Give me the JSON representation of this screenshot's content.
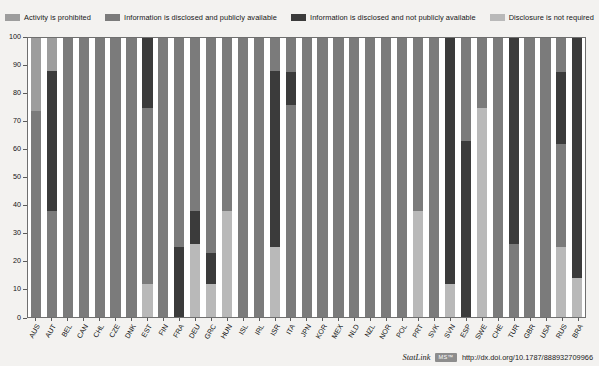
{
  "legend": {
    "position": "top",
    "items": [
      {
        "label": "Activity is prohibited",
        "color": "#9d9d9d",
        "key": "prohibited"
      },
      {
        "label": "Information is disclosed and publicly available",
        "color": "#7b7b7b",
        "key": "disclosed_public"
      },
      {
        "label": "Information is disclosed and not publicly available",
        "color": "#3b3b3b",
        "key": "disclosed_not_public"
      },
      {
        "label": "Disclosure is not required",
        "color": "#b9b9b9",
        "key": "not_required"
      }
    ]
  },
  "yaxis": {
    "ticks": [
      0,
      10,
      20,
      30,
      40,
      50,
      60,
      70,
      80,
      90,
      100
    ],
    "min": 0,
    "max": 100
  },
  "footer": {
    "statlink_text": "StatLink",
    "statlink_badge": "MS™",
    "doi": "http://dx.doi.org/10.1787/888932709966"
  },
  "chart_data": {
    "type": "bar",
    "subtype": "stacked-100-percent",
    "title": "",
    "xlabel": "",
    "ylabel": "",
    "ylim": [
      0,
      100
    ],
    "grid": false,
    "legend_position": "top",
    "series_order": [
      "prohibited",
      "disclosed_public",
      "disclosed_not_public",
      "not_required"
    ],
    "series_colors": {
      "prohibited": "#9d9d9d",
      "disclosed_public": "#7b7b7b",
      "disclosed_not_public": "#3b3b3b",
      "not_required": "#b9b9b9"
    },
    "categories": [
      "AUS",
      "AUT",
      "BEL",
      "CAN",
      "CHL",
      "CZE",
      "DNK",
      "EST",
      "FIN",
      "FRA",
      "DEU",
      "GRC",
      "HUN",
      "ISL",
      "IRL",
      "ISR",
      "ITA",
      "JPN",
      "KOR",
      "MEX",
      "NLD",
      "NZL",
      "NOR",
      "POL",
      "PRT",
      "SVK",
      "SVN",
      "ESP",
      "SWE",
      "CHE",
      "TUR",
      "GBR",
      "USA",
      "RUS",
      "BRA"
    ],
    "series": [
      {
        "name": "Activity is prohibited",
        "key": "prohibited",
        "values": [
          26,
          38,
          0,
          0,
          0,
          0,
          0,
          0,
          0,
          0,
          0,
          0,
          0,
          0,
          0,
          0,
          0,
          0,
          0,
          0,
          0,
          0,
          0,
          0,
          0,
          0,
          0,
          0,
          0,
          0,
          0,
          0,
          0,
          0,
          0
        ]
      },
      {
        "name": "Information is disclosed and publicly available",
        "key": "disclosed_public",
        "values": [
          74,
          12,
          100,
          100,
          100,
          100,
          100,
          63,
          100,
          75,
          62,
          77,
          62,
          100,
          100,
          12,
          76,
          100,
          100,
          100,
          100,
          100,
          100,
          100,
          100,
          100,
          100,
          63,
          75,
          100,
          26,
          100,
          100,
          62,
          14
        ]
      },
      {
        "name": "Information is disclosed and not publicly available",
        "key": "disclosed_not_public",
        "values": [
          0,
          50,
          0,
          0,
          0,
          0,
          0,
          12,
          0,
          25,
          38,
          12,
          13,
          0,
          0,
          63,
          12,
          0,
          0,
          0,
          0,
          0,
          0,
          0,
          0,
          0,
          0,
          37,
          25,
          0,
          74,
          0,
          0,
          13,
          86
        ]
      },
      {
        "name": "Disclosure is not required",
        "key": "not_required",
        "values": [
          0,
          0,
          0,
          0,
          0,
          0,
          0,
          25,
          0,
          0,
          0,
          11,
          25,
          0,
          0,
          25,
          12,
          0,
          0,
          0,
          0,
          0,
          0,
          0,
          0,
          0,
          0,
          0,
          0,
          0,
          0,
          0,
          0,
          25,
          0
        ]
      }
    ],
    "stacks": [
      {
        "category": "AUS",
        "segments": [
          {
            "key": "prohibited",
            "from": 74,
            "to": 100
          },
          {
            "key": "disclosed_public",
            "from": 0,
            "to": 74
          }
        ]
      },
      {
        "category": "AUT",
        "segments": [
          {
            "key": "prohibited",
            "from": 88,
            "to": 100
          },
          {
            "key": "disclosed_not_public",
            "from": 38,
            "to": 88
          },
          {
            "key": "disclosed_public",
            "from": 0,
            "to": 38
          }
        ]
      },
      {
        "category": "BEL",
        "segments": [
          {
            "key": "disclosed_public",
            "from": 0,
            "to": 100
          }
        ]
      },
      {
        "category": "CAN",
        "segments": [
          {
            "key": "disclosed_public",
            "from": 0,
            "to": 100
          }
        ]
      },
      {
        "category": "CHL",
        "segments": [
          {
            "key": "disclosed_public",
            "from": 0,
            "to": 100
          }
        ]
      },
      {
        "category": "CZE",
        "segments": [
          {
            "key": "disclosed_public",
            "from": 0,
            "to": 100
          }
        ]
      },
      {
        "category": "DNK",
        "segments": [
          {
            "key": "disclosed_public",
            "from": 0,
            "to": 100
          }
        ]
      },
      {
        "category": "EST",
        "segments": [
          {
            "key": "disclosed_not_public",
            "from": 75,
            "to": 100
          },
          {
            "key": "disclosed_public",
            "from": 12,
            "to": 75
          },
          {
            "key": "not_required",
            "from": 0,
            "to": 12
          }
        ]
      },
      {
        "category": "FIN",
        "segments": [
          {
            "key": "disclosed_public",
            "from": 0,
            "to": 100
          }
        ]
      },
      {
        "category": "FRA",
        "segments": [
          {
            "key": "disclosed_public",
            "from": 25,
            "to": 100
          },
          {
            "key": "disclosed_not_public",
            "from": 0,
            "to": 25
          }
        ]
      },
      {
        "category": "DEU",
        "segments": [
          {
            "key": "disclosed_public",
            "from": 38,
            "to": 100
          },
          {
            "key": "disclosed_not_public",
            "from": 26,
            "to": 38
          },
          {
            "key": "not_required",
            "from": 0,
            "to": 26
          }
        ]
      },
      {
        "category": "GRC",
        "segments": [
          {
            "key": "disclosed_public",
            "from": 23,
            "to": 100
          },
          {
            "key": "disclosed_not_public",
            "from": 12,
            "to": 23
          },
          {
            "key": "not_required",
            "from": 0,
            "to": 12
          }
        ]
      },
      {
        "category": "HUN",
        "segments": [
          {
            "key": "disclosed_public",
            "from": 38,
            "to": 100
          },
          {
            "key": "not_required",
            "from": 0,
            "to": 38
          }
        ]
      },
      {
        "category": "ISL",
        "segments": [
          {
            "key": "disclosed_public",
            "from": 0,
            "to": 100
          }
        ]
      },
      {
        "category": "IRL",
        "segments": [
          {
            "key": "disclosed_public",
            "from": 0,
            "to": 100
          }
        ]
      },
      {
        "category": "ISR",
        "segments": [
          {
            "key": "disclosed_public",
            "from": 88,
            "to": 100
          },
          {
            "key": "disclosed_not_public",
            "from": 25,
            "to": 88
          },
          {
            "key": "not_required",
            "from": 0,
            "to": 25
          }
        ]
      },
      {
        "category": "ITA",
        "segments": [
          {
            "key": "disclosed_public",
            "from": 88,
            "to": 100
          },
          {
            "key": "disclosed_not_public",
            "from": 76,
            "to": 88
          },
          {
            "key": "disclosed_public",
            "from": 0,
            "to": 76
          }
        ]
      },
      {
        "category": "JPN",
        "segments": [
          {
            "key": "disclosed_public",
            "from": 0,
            "to": 100
          }
        ]
      },
      {
        "category": "KOR",
        "segments": [
          {
            "key": "disclosed_public",
            "from": 0,
            "to": 100
          }
        ]
      },
      {
        "category": "MEX",
        "segments": [
          {
            "key": "disclosed_public",
            "from": 88,
            "to": 100
          },
          {
            "key": "disclosed_public",
            "from": 0,
            "to": 88
          }
        ]
      },
      {
        "category": "NLD",
        "segments": [
          {
            "key": "disclosed_public",
            "from": 0,
            "to": 100
          }
        ]
      },
      {
        "category": "NZL",
        "segments": [
          {
            "key": "disclosed_public",
            "from": 0,
            "to": 100
          }
        ]
      },
      {
        "category": "NOR",
        "segments": [
          {
            "key": "disclosed_public",
            "from": 0,
            "to": 100
          }
        ]
      },
      {
        "category": "POL",
        "segments": [
          {
            "key": "disclosed_public",
            "from": 0,
            "to": 100
          }
        ]
      },
      {
        "category": "PRT",
        "segments": [
          {
            "key": "disclosed_public",
            "from": 38,
            "to": 100
          },
          {
            "key": "not_required",
            "from": 0,
            "to": 38
          }
        ]
      },
      {
        "category": "SVK",
        "segments": [
          {
            "key": "disclosed_public",
            "from": 0,
            "to": 100
          }
        ]
      },
      {
        "category": "SVN",
        "segments": [
          {
            "key": "disclosed_not_public",
            "from": 12,
            "to": 100
          },
          {
            "key": "not_required",
            "from": 0,
            "to": 12
          }
        ]
      },
      {
        "category": "ESP",
        "segments": [
          {
            "key": "disclosed_public",
            "from": 63,
            "to": 100
          },
          {
            "key": "disclosed_not_public",
            "from": 0,
            "to": 63
          }
        ]
      },
      {
        "category": "SWE",
        "segments": [
          {
            "key": "disclosed_public",
            "from": 75,
            "to": 100
          },
          {
            "key": "not_required",
            "from": 0,
            "to": 75
          }
        ]
      },
      {
        "category": "CHE",
        "segments": [
          {
            "key": "disclosed_public",
            "from": 0,
            "to": 100
          }
        ]
      },
      {
        "category": "TUR",
        "segments": [
          {
            "key": "disclosed_not_public",
            "from": 26,
            "to": 100
          },
          {
            "key": "disclosed_public",
            "from": 0,
            "to": 26
          }
        ]
      },
      {
        "category": "GBR",
        "segments": [
          {
            "key": "disclosed_public",
            "from": 88,
            "to": 100
          },
          {
            "key": "disclosed_public",
            "from": 0,
            "to": 88
          }
        ]
      },
      {
        "category": "USA",
        "segments": [
          {
            "key": "disclosed_public",
            "from": 0,
            "to": 100
          }
        ]
      },
      {
        "category": "RUS",
        "segments": [
          {
            "key": "disclosed_public",
            "from": 88,
            "to": 100
          },
          {
            "key": "disclosed_not_public",
            "from": 62,
            "to": 88
          },
          {
            "key": "disclosed_public",
            "from": 25,
            "to": 62
          },
          {
            "key": "not_required",
            "from": 0,
            "to": 25
          }
        ]
      },
      {
        "category": "BRA",
        "segments": [
          {
            "key": "disclosed_not_public",
            "from": 14,
            "to": 100
          },
          {
            "key": "not_required",
            "from": 0,
            "to": 14
          }
        ]
      }
    ]
  }
}
